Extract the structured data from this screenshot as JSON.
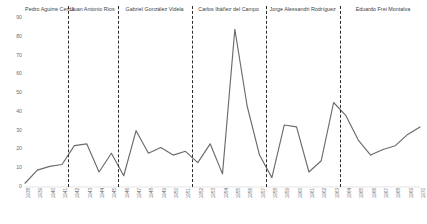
{
  "chart_data": {
    "type": "line",
    "title": "",
    "xlabel": "",
    "ylabel": "",
    "ylim": [
      0,
      90
    ],
    "yticks": [
      0,
      10,
      20,
      30,
      40,
      50,
      60,
      70,
      80,
      90
    ],
    "grid": false,
    "legend": "none",
    "categories": [
      "1938",
      "1939",
      "1940",
      "1941",
      "1942",
      "1943",
      "1944",
      "1945",
      "1946",
      "1947",
      "1948",
      "1949",
      "1950",
      "1951",
      "1952",
      "1953",
      "1954",
      "1955",
      "1956",
      "1957",
      "1958",
      "1959",
      "1960",
      "1961",
      "1962",
      "1963",
      "1964",
      "1965",
      "1966",
      "1967",
      "1968",
      "1969",
      "1970"
    ],
    "series": [
      {
        "name": "value",
        "values": [
          2,
          9,
          11,
          12,
          22,
          23,
          8,
          18,
          6,
          30,
          18,
          21,
          17,
          19,
          13,
          23,
          7,
          84,
          43,
          17,
          5,
          33,
          32,
          8,
          14,
          45,
          38,
          25,
          17,
          20,
          22,
          28,
          32
        ]
      }
    ],
    "annotations": [
      {
        "name": "Pedro Aguirre Cerda",
        "start": "1938",
        "end": "1941"
      },
      {
        "name": "Juan Antonio Ríos",
        "start": "1942",
        "end": "1945"
      },
      {
        "name": "Gabriel González Videla",
        "start": "1946",
        "end": "1951"
      },
      {
        "name": "Carlos Ibáñez del Campo",
        "start": "1952",
        "end": "1957"
      },
      {
        "name": "Jorge Alessandri Rodríguez",
        "start": "1958",
        "end": "1963"
      },
      {
        "name": "Eduardo Frei Montalva",
        "start": "1964",
        "end": "1970"
      }
    ],
    "divider_years": [
      "1942",
      "1946",
      "1952",
      "1958",
      "1964"
    ],
    "colors": {
      "line": "#6b6b6b",
      "divider": "#2b2b2b",
      "tick_text": "#6e6e6e",
      "label_text": "#3f3f3f",
      "background": "#ffffff"
    }
  }
}
